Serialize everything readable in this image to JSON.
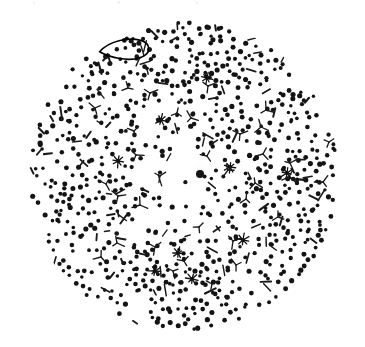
{
  "figure": {
    "title": "",
    "caption": "",
    "background_color": "#ffffff",
    "ink_color": "#111111",
    "annotation_color": "#000000",
    "canvas": {
      "width": 365,
      "height": 347
    }
  },
  "field": {
    "name": "circular-dot-field",
    "shape": "circle",
    "center_x": 183,
    "center_y": 176,
    "radius": 156,
    "description": "Circular field densely populated with small black dots, sparser near the center, with scattered dash, tripod and asterisk glyphs.",
    "dot_color": "#141414",
    "dot_radius_min": 1.7,
    "dot_radius_max": 2.6,
    "center_marker": {
      "name": "center-large-dot",
      "x": 200,
      "y": 174,
      "radius": 4.0,
      "halo_radius": 13,
      "halo_color": "#f5f5f5"
    }
  },
  "annotation": {
    "name": "ellipse-annotation",
    "type": "hand-drawn-lens-ellipse",
    "center_x": 125,
    "center_y": 50,
    "width": 51,
    "height": 17,
    "rotation_deg": -4,
    "stroke_color": "#000000",
    "stroke_width": 1.6,
    "enclosed_dot_count": 6,
    "label": ""
  },
  "glyph_legend": [
    {
      "name": "dot-glyph",
      "symbol": "•",
      "label": "dot",
      "count_approx": 760
    },
    {
      "name": "dash-glyph",
      "symbol": "/",
      "label": "short dash",
      "count_approx": 86
    },
    {
      "name": "tripod-glyph",
      "symbol": "Y",
      "label": "tripod / Y-shape",
      "count_approx": 34
    },
    {
      "name": "asterisk-glyph",
      "symbol": "✳",
      "label": "asterisk / star",
      "count_approx": 9
    }
  ],
  "chart_data": {
    "type": "scatter",
    "title": "",
    "xlabel": "",
    "ylabel": "",
    "grid": false,
    "legend": "none",
    "xlim": [
      0,
      365
    ],
    "ylim": [
      0,
      347
    ],
    "clip_circle": {
      "cx": 183,
      "cy": 176,
      "r": 156
    },
    "density_profile": {
      "description": "Dot areal density increases with radius from center",
      "radius_bins": [
        0,
        26,
        52,
        78,
        104,
        130,
        156
      ],
      "relative_density": [
        0.28,
        0.45,
        0.62,
        0.82,
        1.0,
        1.05
      ]
    },
    "series": [
      {
        "name": "dots",
        "marker": "dot-glyph",
        "color": "#141414",
        "generator": "poisson-disc-radial",
        "seed": 20240517,
        "count_approx": 760
      },
      {
        "name": "dashes",
        "marker": "dash-glyph",
        "color": "#1a1a1a",
        "seed": 7741,
        "count_approx": 86,
        "length_range": [
          5,
          12
        ]
      },
      {
        "name": "tripods",
        "marker": "tripod-glyph",
        "color": "#1a1a1a",
        "points": [
          [
            150,
            93
          ],
          [
            134,
            131
          ],
          [
            208,
            86
          ],
          [
            136,
            155
          ],
          [
            191,
            118
          ],
          [
            261,
            127
          ],
          [
            263,
            154
          ],
          [
            177,
            113
          ],
          [
            240,
            134
          ],
          [
            255,
            183
          ],
          [
            246,
            199
          ],
          [
            289,
            177
          ],
          [
            233,
            241
          ],
          [
            106,
            184
          ],
          [
            118,
            196
          ],
          [
            140,
            205
          ],
          [
            117,
            243
          ],
          [
            184,
            261
          ],
          [
            173,
            271
          ],
          [
            290,
            163
          ],
          [
            212,
            284
          ],
          [
            95,
            108
          ],
          [
            329,
            142
          ],
          [
            323,
            182
          ],
          [
            101,
            257
          ],
          [
            155,
            247
          ],
          [
            199,
            227
          ],
          [
            266,
            110
          ],
          [
            278,
            217
          ],
          [
            160,
            176
          ],
          [
            207,
            156
          ],
          [
            228,
            170
          ],
          [
            128,
            88
          ],
          [
            236,
            265
          ]
        ]
      },
      {
        "name": "asterisks",
        "marker": "asterisk-glyph",
        "color": "#111111",
        "points": [
          [
            287,
            173
          ],
          [
            178,
            253
          ],
          [
            192,
            279
          ],
          [
            161,
            120
          ],
          [
            230,
            167
          ],
          [
            243,
            240
          ],
          [
            118,
            161
          ],
          [
            207,
            78
          ],
          [
            155,
            271
          ]
        ],
        "spokes": 8,
        "radius_range": [
          4,
          7
        ]
      }
    ]
  }
}
